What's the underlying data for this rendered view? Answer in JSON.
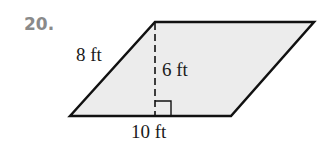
{
  "problem": {
    "number": "20."
  },
  "figure": {
    "shape": "parallelogram",
    "fill_color": "#ececec",
    "stroke_color": "#111111",
    "vertices": [
      [
        70,
        116
      ],
      [
        155,
        22
      ],
      [
        314,
        22
      ],
      [
        231,
        116
      ]
    ],
    "labels": {
      "side": "8 ft",
      "height": "6 ft",
      "base": "10 ft"
    },
    "height_line": "dashed",
    "right_angle_marker": true
  }
}
